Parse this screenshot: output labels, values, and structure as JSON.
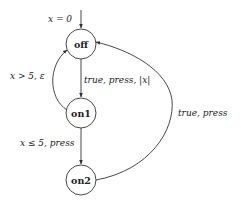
{
  "diagram": {
    "type": "state-machine",
    "nodes": [
      {
        "id": "off",
        "label": "off"
      },
      {
        "id": "on1",
        "label": "on1"
      },
      {
        "id": "on2",
        "label": "on2"
      }
    ],
    "initial": {
      "target": "off",
      "label": "x = 0"
    },
    "edges": [
      {
        "from": "off",
        "to": "on1",
        "label": "true, press, |x|"
      },
      {
        "from": "on1",
        "to": "off",
        "label": "x > 5, ε"
      },
      {
        "from": "on1",
        "to": "on2",
        "label": "x ≤ 5, press"
      },
      {
        "from": "on2",
        "to": "off",
        "label": "true, press"
      }
    ]
  }
}
